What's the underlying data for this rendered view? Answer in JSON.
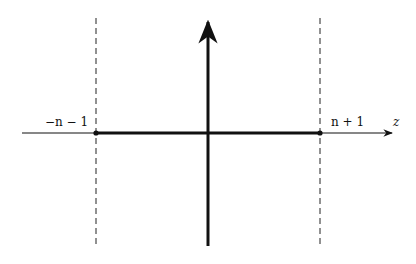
{
  "diagram": {
    "type": "complex-plane-contour",
    "axes": {
      "horizontal_label": "z",
      "origin": [
        208,
        133
      ]
    },
    "points": [
      {
        "id": "left",
        "label": "−n − 1",
        "x": 96
      },
      {
        "id": "right",
        "label": "n + 1",
        "x": 320
      }
    ],
    "segment": {
      "from": "left",
      "to": "right",
      "style": "thick"
    },
    "dashed_lines": [
      "left",
      "right"
    ],
    "colors": {
      "stroke": "#111111",
      "dashed": "#222222",
      "background": "#ffffff"
    }
  }
}
